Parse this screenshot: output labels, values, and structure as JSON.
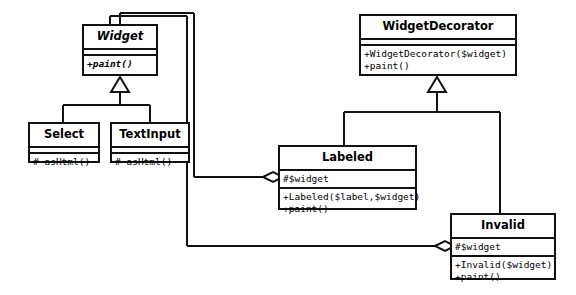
{
  "diagram": {
    "type": "uml-class-diagram",
    "background_color": "#ffffff",
    "line_color": "#111111",
    "text_color": "#000000",
    "classes": [
      {
        "id": "widget",
        "name": "Widget",
        "abstract": true,
        "attributes": [],
        "methods": [
          "+paint()"
        ],
        "methods_italic": true,
        "x": 82,
        "y": 24,
        "w": 76,
        "h": 52
      },
      {
        "id": "select",
        "name": "Select",
        "abstract": false,
        "attributes": [],
        "methods": [
          "# asHtml()"
        ],
        "methods_italic": false,
        "x": 28,
        "y": 122,
        "w": 72,
        "h": 41
      },
      {
        "id": "textinput",
        "name": "TextInput",
        "abstract": false,
        "attributes": [],
        "methods": [
          "# asHtml()"
        ],
        "methods_italic": false,
        "x": 110,
        "y": 122,
        "w": 80,
        "h": 41
      },
      {
        "id": "widgetdecorator",
        "name": "WidgetDecorator",
        "abstract": false,
        "attributes": [],
        "methods": [
          "+WidgetDecorator($widget)",
          "+paint()"
        ],
        "methods_italic": false,
        "x": 359,
        "y": 14,
        "w": 158,
        "h": 62
      },
      {
        "id": "labeled",
        "name": "Labeled",
        "abstract": false,
        "attributes": [
          "#$widget"
        ],
        "methods": [
          "+Labeled($label,$widget)",
          "+paint()"
        ],
        "methods_italic": false,
        "x": 278,
        "y": 145,
        "w": 139,
        "h": 65
      },
      {
        "id": "invalid",
        "name": "Invalid",
        "abstract": false,
        "attributes": [
          "#$widget"
        ],
        "methods": [
          "+Invalid($widget)",
          "+paint()"
        ],
        "methods_italic": false,
        "x": 450,
        "y": 213,
        "w": 106,
        "h": 67
      }
    ],
    "relationships": [
      {
        "kind": "generalization",
        "from": "Select",
        "to": "Widget",
        "marker": "hollow-triangle"
      },
      {
        "kind": "generalization",
        "from": "TextInput",
        "to": "Widget",
        "marker": "hollow-triangle"
      },
      {
        "kind": "generalization",
        "from": "WidgetDecorator",
        "to": "Widget",
        "marker": "hollow-triangle"
      },
      {
        "kind": "generalization",
        "from": "Labeled",
        "to": "WidgetDecorator",
        "marker": "hollow-triangle"
      },
      {
        "kind": "generalization",
        "from": "Invalid",
        "to": "WidgetDecorator",
        "marker": "hollow-triangle"
      },
      {
        "kind": "aggregation",
        "from": "Labeled",
        "to": "Widget",
        "marker": "hollow-diamond"
      },
      {
        "kind": "aggregation",
        "from": "Invalid",
        "to": "Widget",
        "marker": "hollow-diamond"
      }
    ]
  }
}
